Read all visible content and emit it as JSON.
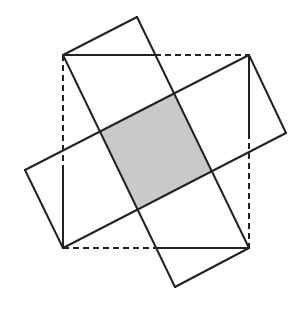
{
  "diagram": {
    "type": "geometric-dissection",
    "shaded_color": "#c9c9c9",
    "stroke_color": "#222222",
    "shaded_square": [
      [
        100,
        131
      ],
      [
        174,
        94
      ],
      [
        212,
        172
      ],
      [
        137,
        208
      ]
    ],
    "dashed_square": [
      [
        63,
        55
      ],
      [
        249,
        55
      ],
      [
        249,
        248
      ],
      [
        63,
        248
      ]
    ],
    "solid_segments": [
      [
        [
          63,
          55
        ],
        [
          137,
          17
        ]
      ],
      [
        [
          137,
          17
        ],
        [
          249,
          248
        ]
      ],
      [
        [
          63,
          55
        ],
        [
          175,
          287
        ]
      ],
      [
        [
          175,
          287
        ],
        [
          249,
          248
        ]
      ],
      [
        [
          25,
          170
        ],
        [
          249,
          55
        ]
      ],
      [
        [
          25,
          170
        ],
        [
          63,
          248
        ]
      ],
      [
        [
          63,
          248
        ],
        [
          286,
          133
        ]
      ],
      [
        [
          249,
          55
        ],
        [
          286,
          133
        ]
      ],
      [
        [
          63,
          55
        ],
        [
          155,
          55
        ]
      ],
      [
        [
          249,
          55
        ],
        [
          249,
          133
        ]
      ],
      [
        [
          157,
          248
        ],
        [
          249,
          248
        ]
      ],
      [
        [
          63,
          170
        ],
        [
          63,
          248
        ]
      ]
    ],
    "dashed_segments": [
      [
        [
          155,
          55
        ],
        [
          249,
          55
        ]
      ],
      [
        [
          249,
          133
        ],
        [
          249,
          248
        ]
      ],
      [
        [
          63,
          248
        ],
        [
          157,
          248
        ]
      ],
      [
        [
          63,
          55
        ],
        [
          63,
          170
        ]
      ]
    ]
  }
}
